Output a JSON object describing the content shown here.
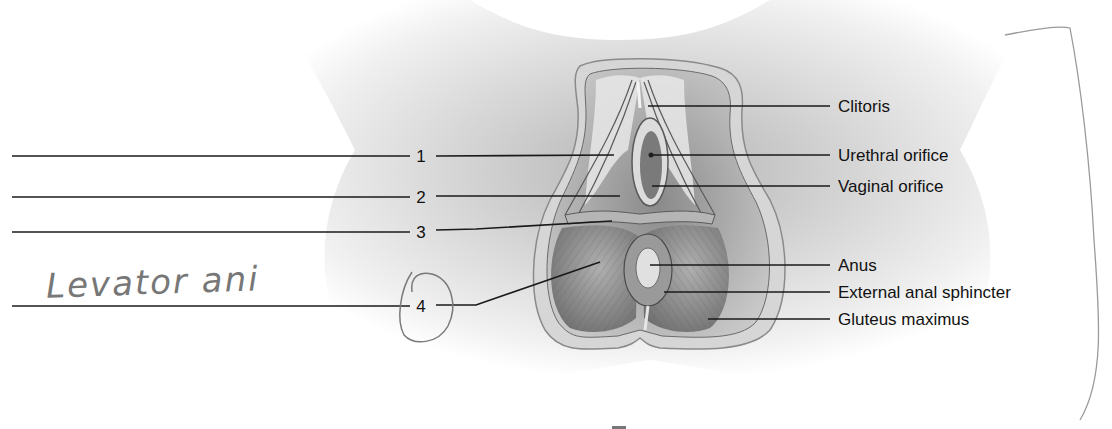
{
  "diagram": {
    "right_labels": [
      {
        "id": "clitoris",
        "text": "Clitoris"
      },
      {
        "id": "urethral-orifice",
        "text": "Urethral orifice"
      },
      {
        "id": "vaginal-orifice",
        "text": "Vaginal orifice"
      },
      {
        "id": "anus",
        "text": "Anus"
      },
      {
        "id": "external-anal-sphincter",
        "text": "External anal sphincter"
      },
      {
        "id": "gluteus-maximus",
        "text": "Gluteus maximus"
      }
    ],
    "numbered_labels": [
      {
        "number": "1",
        "answer": ""
      },
      {
        "number": "2",
        "answer": ""
      },
      {
        "number": "3",
        "answer": ""
      },
      {
        "number": "4",
        "answer": "Levator ani"
      }
    ],
    "handwriting": {
      "answer_4": "Levator ani",
      "circled_number": "4"
    },
    "colors": {
      "line": "#1a1a1a",
      "pencil": "#7a7a7a",
      "skin_light": "#e6e6e6",
      "skin_mid": "#b5b5b5",
      "muscle": "#8e8e8e"
    }
  }
}
